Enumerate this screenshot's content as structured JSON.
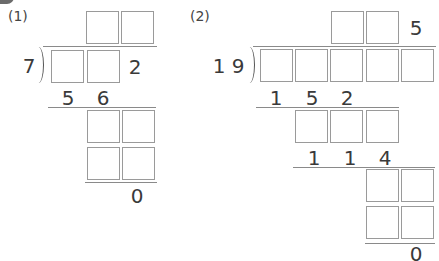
{
  "badge_color": "#6b6b6b",
  "problems": [
    {
      "label": "(1)",
      "divisor": "7",
      "quotient_known": [],
      "dividend_known_last": "2",
      "step1_product": [
        "5",
        "6"
      ],
      "remainder": "0"
    },
    {
      "label": "(2)",
      "divisor_digits": [
        "1",
        "9"
      ],
      "quotient_known_last": "5",
      "step1_product": [
        "1",
        "5",
        "2"
      ],
      "step2_product": [
        "1",
        "1",
        "4"
      ],
      "remainder": "0"
    }
  ]
}
